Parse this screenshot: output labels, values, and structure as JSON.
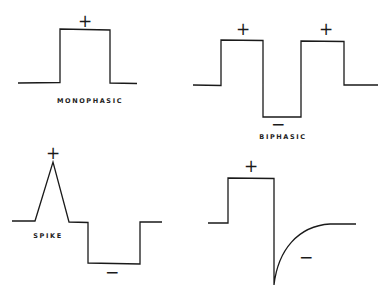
{
  "diagrams": [
    {
      "id": "monophasic",
      "label": "MONOPHASIC",
      "signs": [
        "+"
      ]
    },
    {
      "id": "biphasic",
      "label": "BIPHASIC",
      "signs": [
        "+",
        "+",
        "−"
      ]
    },
    {
      "id": "spike",
      "label": "SPIKE",
      "signs": [
        "+",
        "−"
      ]
    },
    {
      "id": "exponential",
      "label": "",
      "signs": [
        "+",
        "−"
      ]
    }
  ],
  "colors": {
    "line": "#1a1a1a",
    "background": "#ffffff"
  }
}
